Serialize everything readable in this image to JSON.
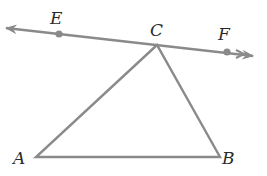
{
  "diagram": {
    "type": "geometry",
    "colors": {
      "stroke": "#8a8a8a",
      "label": "#2a2a2a",
      "background": "#ffffff"
    },
    "line": {
      "name": "EF",
      "through": [
        "E",
        "C",
        "F"
      ],
      "arrows": "both ends"
    },
    "triangle": {
      "vertices": [
        "A",
        "B",
        "C"
      ]
    },
    "points": {
      "E": {
        "label": "E",
        "x": 59,
        "y": 34
      },
      "C": {
        "label": "C",
        "x": 157,
        "y": 45
      },
      "F": {
        "label": "F",
        "x": 227,
        "y": 52
      },
      "A": {
        "label": "A",
        "x": 36,
        "y": 157
      },
      "B": {
        "label": "B",
        "x": 220,
        "y": 157
      }
    }
  }
}
